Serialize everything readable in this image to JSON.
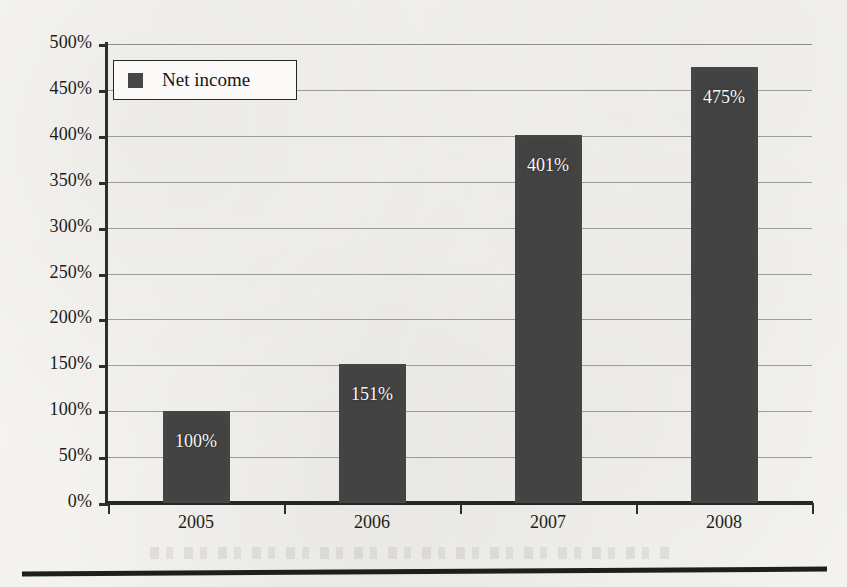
{
  "chart_data": {
    "type": "bar",
    "title": "",
    "xlabel": "",
    "ylabel": "",
    "categories": [
      "2005",
      "2006",
      "2007",
      "2008"
    ],
    "values": [
      100,
      151,
      401,
      475
    ],
    "value_labels": [
      "100%",
      "151%",
      "401%",
      "475%"
    ],
    "ylim": [
      0,
      500
    ],
    "ytick_values": [
      0,
      50,
      100,
      150,
      200,
      250,
      300,
      350,
      400,
      450,
      500
    ],
    "ytick_labels": [
      "0%",
      "50%",
      "100%",
      "150%",
      "200%",
      "250%",
      "300%",
      "350%",
      "400%",
      "450%",
      "500%"
    ],
    "grid": true,
    "legend_position": "top-left",
    "series": [
      {
        "name": "Net income",
        "values": [
          100,
          151,
          401,
          475
        ],
        "color": "#424242"
      }
    ],
    "units": "percent",
    "annotations": []
  },
  "legend": {
    "entries": [
      {
        "label": "Net income",
        "color": "#424242",
        "marker": "square"
      }
    ]
  },
  "colors": {
    "bar_fill": "#424242",
    "axis": "#262624",
    "gridline": "#8d8d8a",
    "background": "#f3f2ef",
    "value_label": "#f7f7f5",
    "tick_label": "#1c1c1a"
  },
  "icons": {
    "legend_marker": "square-swatch-icon"
  }
}
